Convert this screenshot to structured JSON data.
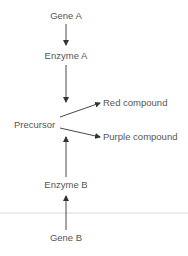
{
  "diagram": {
    "nodes": {
      "gene_a": "Gene A",
      "enzyme_a": "Enzyme A",
      "precursor": "Precursor",
      "red_compound": "Red compound",
      "purple_compound": "Purple compound",
      "enzyme_b": "Enzyme B",
      "gene_b": "Gene B"
    },
    "edges": [
      {
        "from": "Gene A",
        "to": "Enzyme A"
      },
      {
        "from": "Enzyme A",
        "to": "Precursor"
      },
      {
        "from": "Precursor",
        "to": "Red compound"
      },
      {
        "from": "Precursor",
        "to": "Purple compound"
      },
      {
        "from": "Enzyme B",
        "to": "Precursor"
      },
      {
        "from": "Gene B",
        "to": "Enzyme B"
      }
    ],
    "colors": {
      "text": "#555555",
      "arrow": "#333333",
      "divider": "#d9d9d9"
    }
  }
}
